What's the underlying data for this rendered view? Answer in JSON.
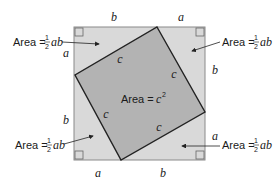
{
  "diagram": {
    "type": "pythagorean-proof-square",
    "colors": {
      "outer_fill": "#d9d9d9",
      "inner_fill": "#b3b3b3",
      "outer_stroke": "#8a8a8a",
      "inner_stroke": "#222222",
      "text": "#1a1a1a"
    },
    "side_labels": {
      "top": [
        "b",
        "a"
      ],
      "right": [
        "a",
        "b"
      ],
      "bottom": [
        "a",
        "b"
      ],
      "left": [
        "a",
        "b"
      ]
    },
    "inner_side_label": "c",
    "center_label": {
      "prefix": "Area = ",
      "var": "c",
      "exponent": "2"
    },
    "triangle_area_labels": [
      {
        "position": "top-left",
        "prefix": "Area = ",
        "num": "1",
        "den": "2",
        "vars": "ab"
      },
      {
        "position": "top-right",
        "prefix": "Area = ",
        "num": "1",
        "den": "2",
        "vars": "ab"
      },
      {
        "position": "bottom-left",
        "prefix": "Area = ",
        "num": "1",
        "den": "2",
        "vars": "ab"
      },
      {
        "position": "bottom-right",
        "prefix": "Area = ",
        "num": "1",
        "den": "2",
        "vars": "ab"
      }
    ]
  }
}
